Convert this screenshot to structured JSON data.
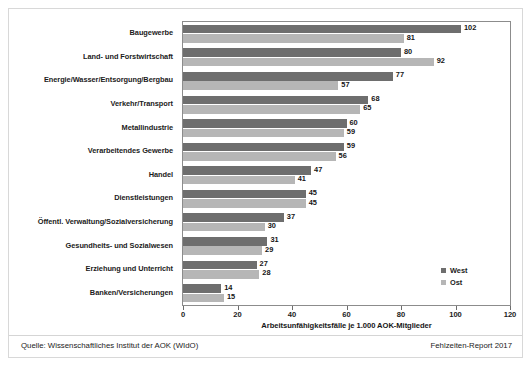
{
  "chart_data": {
    "type": "bar",
    "orientation": "horizontal",
    "title": "",
    "xlabel": "Arbeitsunfähigkeitsfälle je 1.000 AOK-Mitglieder",
    "ylabel": "",
    "xlim": [
      0,
      120
    ],
    "xticks": [
      0,
      20,
      40,
      60,
      80,
      100,
      120
    ],
    "grid": false,
    "legend_position": "inside-bottom-right",
    "categories": [
      "Baugewerbe",
      "Land- und Forstwirtschaft",
      "Energie/Wasser/Entsorgung/Bergbau",
      "Verkehr/Transport",
      "Metallindustrie",
      "Verarbeitendes Gewerbe",
      "Handel",
      "Dienstleistungen",
      "Öffentl. Verwaltung/Sozialversicherung",
      "Gesundheits- und Sozialwesen",
      "Erziehung und Unterricht",
      "Banken/Versicherungen"
    ],
    "series": [
      {
        "name": "West",
        "color": "#6e6e6e",
        "values": [
          102,
          80,
          77,
          68,
          60,
          59,
          47,
          45,
          37,
          31,
          27,
          14
        ]
      },
      {
        "name": "Ost",
        "color": "#b6b6b6",
        "values": [
          81,
          92,
          57,
          65,
          59,
          56,
          41,
          45,
          30,
          29,
          28,
          15
        ]
      }
    ]
  },
  "footer": {
    "source": "Quelle: Wissenschaftliches Institut der AOK (WIdO)",
    "report": "Fehlzeiten-Report 2017"
  }
}
